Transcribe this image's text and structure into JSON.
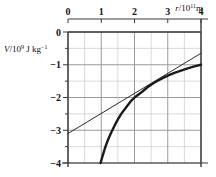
{
  "chart_data": {
    "type": "line",
    "title": "",
    "xlabel": "r/10^11 m",
    "ylabel": "V/10^9 J kg^-1",
    "xlabel_parts": {
      "var": "r",
      "slash": "/",
      "base": "10",
      "exp": "11",
      "unit": "m"
    },
    "ylabel_parts": {
      "var": "V",
      "slash": "/",
      "base": "10",
      "exp": "9",
      "unit": "J kg",
      "unit_exp": "−1"
    },
    "xlim": [
      0,
      4
    ],
    "ylim": [
      -4,
      0
    ],
    "xticks": [
      "0",
      "1",
      "2",
      "3",
      "4"
    ],
    "xtick_values": [
      0,
      1,
      2,
      3,
      4
    ],
    "yticks": [
      "0",
      "−1",
      "−2",
      "−3",
      "−4"
    ],
    "ytick_values": [
      0,
      -1,
      -2,
      -3,
      -4
    ],
    "grid": true,
    "grid_major_step_x": 1,
    "grid_major_step_y": 1,
    "grid_minor_step_x": 0.5,
    "grid_minor_step_y": 0.5,
    "x_axis_position": "top",
    "legend": "none",
    "series": [
      {
        "name": "potential-curve",
        "style": "thick-solid",
        "color": "#1a1a1a",
        "description": "V = -4/r gravitational potential hyperbola",
        "points": [
          [
            0.98,
            -4.0
          ],
          [
            1.05,
            -3.75
          ],
          [
            1.12,
            -3.52
          ],
          [
            1.2,
            -3.3
          ],
          [
            1.3,
            -3.07
          ],
          [
            1.4,
            -2.86
          ],
          [
            1.5,
            -2.67
          ],
          [
            1.6,
            -2.5
          ],
          [
            1.75,
            -2.3
          ],
          [
            1.9,
            -2.1
          ],
          [
            2.0,
            -2.0
          ],
          [
            2.2,
            -1.85
          ],
          [
            2.4,
            -1.68
          ],
          [
            2.6,
            -1.54
          ],
          [
            2.8,
            -1.43
          ],
          [
            3.0,
            -1.33
          ],
          [
            3.2,
            -1.25
          ],
          [
            3.4,
            -1.18
          ],
          [
            3.6,
            -1.11
          ],
          [
            3.8,
            -1.05
          ],
          [
            4.0,
            -1.0
          ]
        ]
      },
      {
        "name": "tangent-line",
        "style": "thin-solid",
        "color": "#2b2b2b",
        "description": "straight tangent line touching the curve near r = 2.2",
        "points": [
          [
            0.0,
            -3.1
          ],
          [
            4.0,
            -0.65
          ]
        ],
        "endpoints": {
          "start": [
            0.0,
            -3.1
          ],
          "end": [
            4.0,
            -0.65
          ]
        },
        "tangent_point": [
          2.2,
          -1.87
        ]
      }
    ]
  },
  "figure": {
    "background": "#ffffff",
    "grid_color": "#9a9a9a",
    "grid_minor_color": "#c8c8c8",
    "axis_color": "#3a3a3a"
  }
}
